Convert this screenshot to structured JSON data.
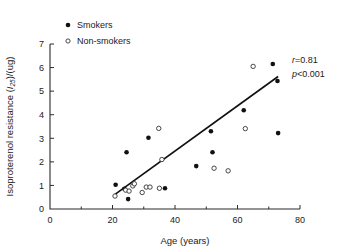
{
  "chart_data": {
    "type": "scatter",
    "title": "",
    "xlabel": "Age (years)",
    "ylabel": "Isoproterenol resistance (I25)/(ug)",
    "ylabel_main": "Isoproterenol resistance (",
    "ylabel_italic": "I",
    "ylabel_subscript": "25",
    "ylabel_tail": ")/(ug)",
    "xlim": [
      0,
      80
    ],
    "ylim": [
      0,
      7
    ],
    "xticks": [
      0,
      20,
      40,
      60,
      80
    ],
    "xticks_minor": [
      10,
      30,
      50,
      70
    ],
    "yticks": [
      0,
      1,
      2,
      3,
      4,
      5,
      6,
      7
    ],
    "grid": false,
    "legend_position": "top-left",
    "legend": [
      {
        "label": "Smokers",
        "marker": "filled-circle"
      },
      {
        "label": "Non-smokers",
        "marker": "open-circle"
      }
    ],
    "annotations": [
      {
        "id": "r-value",
        "italic": "r",
        "rest": "=0.81"
      },
      {
        "id": "p-value",
        "italic": "p",
        "rest": "<0.001"
      }
    ],
    "fit_line": {
      "x1": 20.8,
      "y1": 0.62,
      "x2": 73.0,
      "y2": 5.62
    },
    "series": [
      {
        "name": "Smokers",
        "marker": "filled-circle",
        "points": [
          [
            21.0,
            1.03
          ],
          [
            23.8,
            0.86
          ],
          [
            24.5,
            2.41
          ],
          [
            25.0,
            0.42
          ],
          [
            31.5,
            3.02
          ],
          [
            36.8,
            0.88
          ],
          [
            46.8,
            1.82
          ],
          [
            51.5,
            3.3
          ],
          [
            52.0,
            2.41
          ],
          [
            62.0,
            4.19
          ],
          [
            71.3,
            6.15
          ],
          [
            72.8,
            5.43
          ],
          [
            73.0,
            3.22
          ]
        ]
      },
      {
        "name": "Non-smokers",
        "marker": "open-circle",
        "points": [
          [
            20.8,
            0.55
          ],
          [
            24.2,
            0.8
          ],
          [
            25.3,
            0.76
          ],
          [
            26.5,
            0.98
          ],
          [
            27.0,
            1.07
          ],
          [
            29.5,
            0.7
          ],
          [
            30.8,
            0.93
          ],
          [
            32.0,
            0.93
          ],
          [
            35.0,
            0.88
          ],
          [
            34.8,
            3.42
          ],
          [
            35.8,
            2.1
          ],
          [
            52.5,
            1.73
          ],
          [
            57.0,
            1.62
          ],
          [
            62.5,
            3.41
          ],
          [
            65.0,
            6.05
          ]
        ]
      }
    ]
  }
}
